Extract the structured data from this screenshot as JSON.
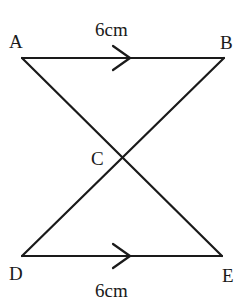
{
  "diagram": {
    "type": "geometry-figure",
    "points": {
      "A": {
        "label": "A",
        "x": 22,
        "y": 58
      },
      "B": {
        "label": "B",
        "x": 224,
        "y": 58
      },
      "C": {
        "label": "C",
        "x": 123,
        "y": 157
      },
      "D": {
        "label": "D",
        "x": 22,
        "y": 256
      },
      "E": {
        "label": "E",
        "x": 222,
        "y": 256
      }
    },
    "segments": [
      {
        "from": "A",
        "to": "B",
        "parallel_marker": true,
        "length_label": "6cm"
      },
      {
        "from": "A",
        "to": "E"
      },
      {
        "from": "B",
        "to": "D"
      },
      {
        "from": "D",
        "to": "E",
        "parallel_marker": true,
        "length_label": "6cm"
      }
    ],
    "labels": {
      "top_length": "6cm",
      "bottom_length": "6cm",
      "A": "A",
      "B": "B",
      "C": "C",
      "D": "D",
      "E": "E"
    },
    "colors": {
      "stroke": "#1a1a1a",
      "background": "#ffffff"
    }
  }
}
